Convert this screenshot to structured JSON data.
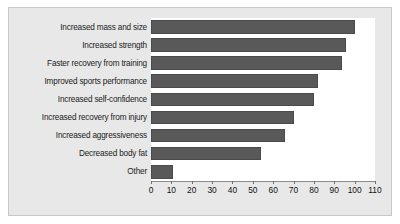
{
  "chart_data": {
    "type": "bar",
    "orientation": "horizontal",
    "title": "",
    "subtitle": "",
    "xlabel": "",
    "ylabel": "",
    "xlim": [
      0,
      110
    ],
    "xticks": [
      0,
      10,
      20,
      30,
      40,
      50,
      60,
      70,
      80,
      90,
      100,
      110
    ],
    "xtick_labels": [
      "0",
      "10",
      "20",
      "30",
      "40",
      "50",
      "60",
      "70",
      "80",
      "90",
      "100",
      "110"
    ],
    "grid": false,
    "legend": false,
    "legend_position": "none",
    "bar_color": "#595959",
    "bar_edge_color": "#4a4a4a",
    "plot_background": "#ffffff",
    "panel_background": "#e8e8e8",
    "panel_border_color": "#c8c8c8",
    "categories": [
      "Increased mass and size",
      "Increased strength",
      "Faster recovery from training",
      "Improved sports performance",
      "Increased self-confidence",
      "Increased recovery from injury",
      "Increased aggressiveness",
      "Decreased body fat",
      "Other"
    ],
    "values": [
      100,
      96,
      94,
      82,
      80,
      70,
      66,
      54,
      11
    ]
  }
}
